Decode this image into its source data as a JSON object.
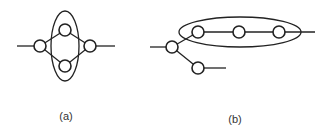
{
  "panels": [
    {
      "label": "(a)"
    },
    {
      "label": "(b)"
    }
  ],
  "colors": {
    "stroke": "#222222",
    "background": "#ffffff"
  }
}
